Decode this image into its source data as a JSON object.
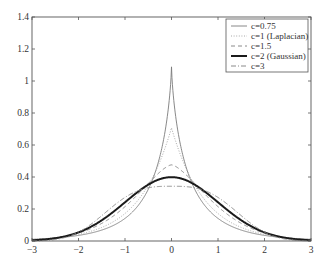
{
  "chart_data": {
    "type": "line",
    "title": "",
    "xlabel": "",
    "ylabel": "",
    "xlim": [
      -3,
      3
    ],
    "ylim": [
      0,
      1.4
    ],
    "grid": false,
    "legend_position": "upper right",
    "x_ticks": [
      -3,
      -2,
      -1,
      0,
      1,
      2,
      3
    ],
    "x_tick_labels": [
      "−3",
      "−2",
      "−1",
      "0",
      "1",
      "2",
      "3"
    ],
    "y_ticks": [
      0,
      0.2,
      0.4,
      0.6,
      0.8,
      1,
      1.2,
      1.4
    ],
    "y_tick_labels": [
      "0",
      "0.2",
      "0.4",
      "0.6",
      "0.8",
      "1",
      "1.2",
      "1.4"
    ],
    "series": [
      {
        "name": "c=0.75",
        "label": "c=0.75",
        "c": 0.75,
        "peak": 1.088,
        "style": "solid",
        "color": "#7a7a7a",
        "width": 0.9,
        "dash": ""
      },
      {
        "name": "c=1 (Laplacian)",
        "label": "c=1 (Laplacian)",
        "c": 1,
        "peak": 0.707,
        "style": "dotted",
        "color": "#a8a8a8",
        "width": 1.0,
        "dash": "1,1.6"
      },
      {
        "name": "c=1.5",
        "label": "c=1.5",
        "c": 1.5,
        "peak": 0.476,
        "style": "dashed",
        "color": "#8a8a8a",
        "width": 1.0,
        "dash": "4,3"
      },
      {
        "name": "c=2 (Gaussian)",
        "label": "c=2 (Gaussian)",
        "c": 2,
        "peak": 0.399,
        "style": "solid-thick",
        "color": "#1a1a1a",
        "width": 2.0,
        "dash": ""
      },
      {
        "name": "c=3",
        "label": "c=3",
        "c": 3,
        "peak": 0.342,
        "style": "dash-dot",
        "color": "#8a8a8a",
        "width": 1.0,
        "dash": "5,2,1,2"
      }
    ],
    "sample_points": {
      "x": [
        -3,
        -2,
        -1,
        -0.5,
        0,
        0.5,
        1,
        2,
        3
      ],
      "c=0.75": [
        0.012,
        0.034,
        0.118,
        0.262,
        1.088,
        0.262,
        0.118,
        0.034,
        0.012
      ],
      "c=1 (Laplacian)": [
        0.01,
        0.042,
        0.172,
        0.349,
        0.707,
        0.349,
        0.172,
        0.042,
        0.01
      ],
      "c=1.5": [
        0.007,
        0.05,
        0.226,
        0.359,
        0.476,
        0.359,
        0.226,
        0.05,
        0.007
      ],
      "c=2 (Gaussian)": [
        0.004,
        0.054,
        0.242,
        0.352,
        0.399,
        0.352,
        0.242,
        0.054,
        0.004
      ],
      "c=3": [
        0.001,
        0.05,
        0.271,
        0.332,
        0.342,
        0.332,
        0.271,
        0.05,
        0.001
      ]
    }
  },
  "plot": {
    "left": 32,
    "top": 17,
    "right": 311,
    "bottom": 241,
    "frame_color": "#555555",
    "background": "#ffffff"
  },
  "legend": {
    "x": 226,
    "y": 19,
    "width": 82,
    "height": 53,
    "items": [
      {
        "label": "c=0.75"
      },
      {
        "label": "c=1 (Laplacian)"
      },
      {
        "label": "c=1.5"
      },
      {
        "label": "c=2 (Gaussian)"
      },
      {
        "label": "c=3"
      }
    ]
  }
}
